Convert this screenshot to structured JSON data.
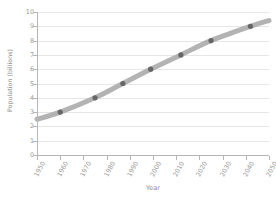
{
  "chart_data": {
    "type": "line",
    "title": "",
    "xlabel": "Year",
    "ylabel": "Population (billions)",
    "xlim": [
      1950,
      2050
    ],
    "ylim": [
      0,
      10
    ],
    "grid": true,
    "legend": false,
    "x_ticks": [
      1950,
      1960,
      1970,
      1980,
      1990,
      2000,
      2010,
      2020,
      2030,
      2040,
      2050
    ],
    "y_ticks": [
      0,
      1,
      2,
      3,
      4,
      5,
      6,
      7,
      8,
      9,
      10
    ],
    "series": [
      {
        "name": "World population",
        "line_color": "#b3b3b3",
        "marker_color": "#666666",
        "x": [
          1960,
          1975,
          1987,
          1999,
          2012,
          2025,
          2042
        ],
        "values": [
          3,
          4,
          5,
          6,
          7,
          8,
          9
        ]
      }
    ],
    "trend_x": [
      1950,
      1960,
      1975,
      1987,
      1999,
      2012,
      2025,
      2042,
      2050
    ],
    "trend_y": [
      2.5,
      3.0,
      4.0,
      5.0,
      6.0,
      7.0,
      8.0,
      9.0,
      9.4
    ]
  },
  "colors": {
    "background": "#ffffff",
    "grid": "#e6e6e6",
    "axis": "#b6b6b6",
    "tick_text": "#9a9a9a",
    "label_text": "#8d8d8d",
    "line": "#b3b3b3",
    "marker": "#666666"
  }
}
